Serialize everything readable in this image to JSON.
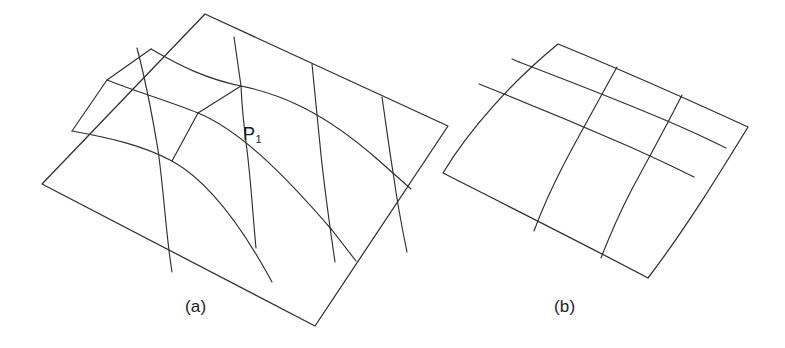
{
  "document": {
    "title": "Quadrilateral mesh surface patches",
    "background_color": "#ffffff",
    "line_color": "#2e2e33",
    "text_color": "#1d1d20"
  },
  "figures": [
    {
      "id": "figure-a",
      "caption": "(a)",
      "description": "Irregular quadrilateral mesh on a nearly planar surface patch with an irregular vertex",
      "labels": [
        {
          "id": "p1",
          "text": "P",
          "subscript": "1",
          "x": 243,
          "y": 124
        }
      ],
      "outline_corners": [
        {
          "name": "top",
          "x": 205,
          "y": 14
        },
        {
          "name": "right",
          "x": 448,
          "y": 126
        },
        {
          "name": "bottom",
          "x": 315,
          "y": 326
        },
        {
          "name": "left",
          "x": 42,
          "y": 184
        }
      ],
      "grid_rows": 4,
      "grid_cols": 4,
      "irregular_vertex": "P1"
    },
    {
      "id": "figure-b",
      "caption": "(b)",
      "description": "Regular 3x3 quadrilateral mesh on a smoothly curved surface patch",
      "labels": [],
      "outline_corners": [
        {
          "name": "top",
          "x": 558,
          "y": 44
        },
        {
          "name": "right",
          "x": 748,
          "y": 127
        },
        {
          "name": "bottom",
          "x": 648,
          "y": 278
        },
        {
          "name": "left",
          "x": 443,
          "y": 173
        }
      ],
      "grid_rows": 3,
      "grid_cols": 3,
      "irregular_vertex": null
    }
  ],
  "geometry": {
    "figure_a": {
      "outline": "M 205 14 L 448 126 L 315 326 L 42 184 Z",
      "u_lines": [
        "M 151 50 C 186 73 214 84 254 90 C 297 96 340 110 395 160",
        "M 107 80 C 147 100 180 106 215 123 C 258 144 300 186 352 241",
        "M 72 130 C 120 140 152 149 186 172 C 226 199 253 253 275 298"
      ],
      "v_lines": [
        "M 137 48 C 152 86 157 122 163 170 C 168 214 166 262 172 299",
        "M 236 37 C 243 79 250 116 254 149 C 259 192 258 247 262 290",
        "M 319 80 C 323 115 325 145 327 175 C 330 213 333 250 337 285",
        "M 389 113 C 392 140 394 162 397 185 C 400 212 404 238 408 262"
      ],
      "extra_segments": [
        "M 108 81 L 151 50",
        "M 72 131 L 107 80",
        "M 254 90 L 236 37",
        "M 215 123 L 254 90"
      ]
    },
    "figure_b": {
      "outline": "M 558 44 L 748 127 L 648 278 L 443 173 Z",
      "u_lines": [
        "M 519 62 C 556 78 592 90 628 100 C 665 111 700 122 719 128",
        "M 480 80 C 520 96 558 110 597 124 C 634 138 668 152 686 162",
        "M 447 112 C 487 127 524 141 561 156 C 598 171 630 186 651 196"
      ],
      "v_lines": [
        "M 513 61 C 505 83 497 106 489 130 C 481 155 478 180 478 196",
        "M 594 80 C 584 106 574 132 565 158 C 556 184 550 208 547 224",
        "M 672 106 C 661 132 651 158 641 184 C 632 209 626 234 623 250"
      ],
      "extra_segments": [
        "M 519 62 L 513 61",
        "M 447 112 L 443 173"
      ]
    }
  }
}
